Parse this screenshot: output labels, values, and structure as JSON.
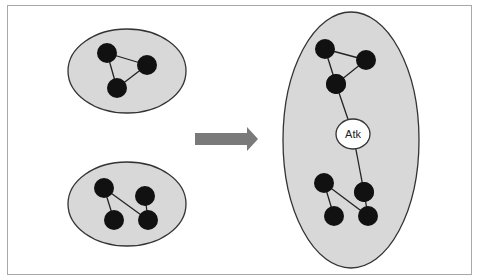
{
  "colors": {
    "group_fill": "#d8d8d8",
    "group_stroke": "#333333",
    "node_fill": "#111111",
    "edge": "#222222",
    "arrow": "#7a7a7a",
    "attacker_fill": "#ffffff",
    "frame": "#a8a8a8"
  },
  "groups": [
    {
      "id": "network-a",
      "ellipse": {
        "cx": 127,
        "cy": 71,
        "rx": 59,
        "ry": 42
      },
      "nodes": [
        [
          107,
          53
        ],
        [
          147,
          65
        ],
        [
          117,
          88
        ]
      ],
      "edges": [
        [
          0,
          1
        ],
        [
          1,
          2
        ],
        [
          0,
          2
        ]
      ]
    },
    {
      "id": "network-b",
      "ellipse": {
        "cx": 127,
        "cy": 204,
        "rx": 59,
        "ry": 42
      },
      "nodes": [
        [
          104,
          188
        ],
        [
          145,
          196
        ],
        [
          114,
          220
        ],
        [
          148,
          220
        ]
      ],
      "edges": [
        [
          0,
          2
        ],
        [
          0,
          3
        ],
        [
          1,
          3
        ]
      ]
    },
    {
      "id": "merged-network",
      "ellipse": {
        "cx": 351,
        "cy": 140,
        "rx": 68,
        "ry": 128
      },
      "nodes": [
        [
          325,
          49
        ],
        [
          366,
          60
        ],
        [
          336,
          84
        ],
        [
          324,
          183
        ],
        [
          364,
          192
        ],
        [
          334,
          216
        ],
        [
          368,
          216
        ]
      ],
      "edges": [
        [
          0,
          1
        ],
        [
          1,
          2
        ],
        [
          0,
          2
        ],
        [
          3,
          5
        ],
        [
          3,
          6
        ],
        [
          4,
          6
        ]
      ]
    }
  ],
  "attacker": {
    "label": "Atk",
    "cx": 353,
    "cy": 134,
    "rx": 17,
    "ry": 15,
    "links": [
      [
        336,
        84
      ],
      [
        364,
        192
      ]
    ]
  },
  "arrow": {
    "x1": 195,
    "x2": 258,
    "y": 139
  }
}
